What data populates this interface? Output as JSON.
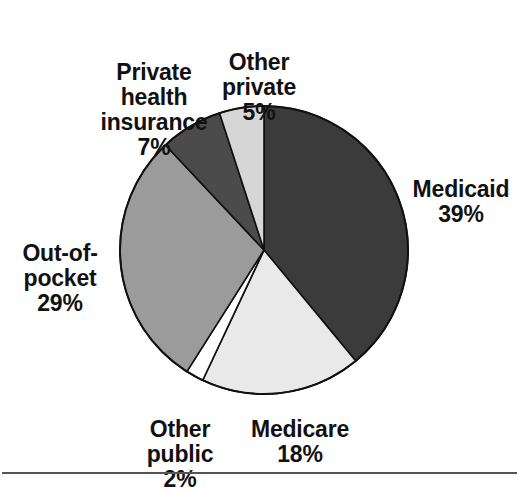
{
  "chart_data": {
    "type": "pie",
    "title": "",
    "subtitle": "",
    "xlabel": "",
    "ylabel": "",
    "units": "percent",
    "legend_position": "none",
    "labels_placement": "outside-callout",
    "start_angle_deg": 0,
    "direction": "clockwise",
    "total": 100,
    "categories": [
      "Medicaid",
      "Medicare",
      "Other public",
      "Out-of-pocket",
      "Private health insurance",
      "Other private"
    ],
    "values": [
      39,
      18,
      2,
      29,
      7,
      5
    ],
    "slices": [
      {
        "name": "Medicaid",
        "label_line1": "Medicaid",
        "value": 39,
        "value_text": "39%",
        "color": "#3b3b3b",
        "start_deg": 0,
        "end_deg": 140.4
      },
      {
        "name": "Medicare",
        "label_line1": "Medicare",
        "value": 18,
        "value_text": "18%",
        "color": "#e9e9e9",
        "start_deg": 140.4,
        "end_deg": 205.2
      },
      {
        "name": "Other public",
        "label_line1": "Other",
        "label_line2": "public",
        "value": 2,
        "value_text": "2%",
        "color": "#ffffff",
        "start_deg": 205.2,
        "end_deg": 212.4
      },
      {
        "name": "Out-of-pocket",
        "label_line1": "Out-of-",
        "label_line2": "pocket",
        "value": 29,
        "value_text": "29%",
        "color": "#9b9b9b",
        "start_deg": 212.4,
        "end_deg": 316.8
      },
      {
        "name": "Private health insurance",
        "label_line1": "Private",
        "label_line2": "health",
        "label_line3": "insurance",
        "value": 7,
        "value_text": "7%",
        "color": "#4b4b4b",
        "start_deg": 316.8,
        "end_deg": 342.0
      },
      {
        "name": "Other private",
        "label_line1": "Other",
        "label_line2": "private",
        "value": 5,
        "value_text": "5%",
        "color": "#d6d6d6",
        "start_deg": 342.0,
        "end_deg": 360.0
      }
    ],
    "geometry": {
      "center_x": 264,
      "center_y": 250,
      "radius": 144,
      "outline_color": "#111111"
    }
  },
  "labels": {
    "medicaid": {
      "name": "Medicaid",
      "pct": "39%"
    },
    "medicare": {
      "name": "Medicare",
      "pct": "18%"
    },
    "other_public": {
      "name": "Other\npublic",
      "pct": "2%"
    },
    "out_of_pocket": {
      "name": "Out-of-\npocket",
      "pct": "29%"
    },
    "private_health_insurance": {
      "name": "Private\nhealth\ninsurance",
      "pct": "7%"
    },
    "other_private": {
      "name": "Other\nprivate",
      "pct": "5%"
    }
  },
  "footer": {
    "rule_color": "#555555"
  }
}
